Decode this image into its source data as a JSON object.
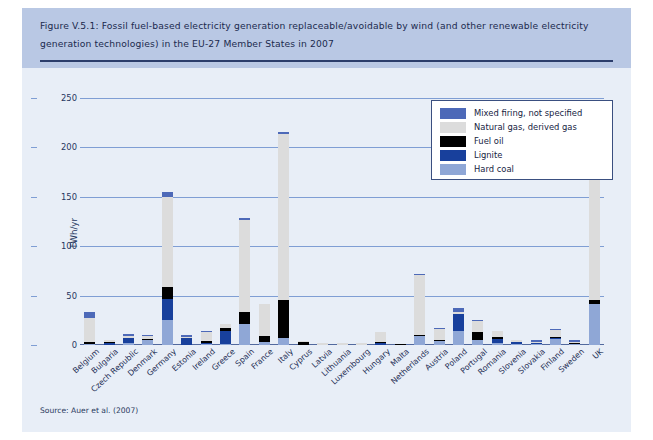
{
  "figure": {
    "title": "Figure V.5.1: Fossil fuel-based electricity generation replaceable/avoidable by wind (and other renewable electricity generation technologies) in the EU-27 Member States in 2007",
    "source": "Source: Auer et al. (2007)"
  },
  "colors": {
    "panel_background": "#e8eef7",
    "title_band": "#b9c8e4",
    "title_text": "#1b2a4e",
    "gridline": "#7f9ed4",
    "mixed_firing": "#4d69b8",
    "natural_gas": "#dcdcdc",
    "fuel_oil": "#000000",
    "lignite": "#18409c",
    "hard_coal": "#8fa7d6"
  },
  "chart_data": {
    "type": "bar",
    "stacked": true,
    "title": "Figure V.5.1: Fossil fuel-based electricity generation replaceable/avoidable by wind (and other renewable electricity generation technologies) in the EU-27 Member States in 2007",
    "xlabel": "",
    "ylabel": "TWh/yr",
    "ylim": [
      0,
      250
    ],
    "yticks": [
      0,
      50,
      100,
      150,
      200,
      250
    ],
    "grid": true,
    "legend_position": "upper-right",
    "categories": [
      "Belgium",
      "Bulgaria",
      "Czech Republic",
      "Denmark",
      "Germany",
      "Estonia",
      "Ireland",
      "Greece",
      "Spain",
      "France",
      "Italy",
      "Cyprus",
      "Latvia",
      "Lithuania",
      "Luxembourg",
      "Hungary",
      "Malta",
      "Netherlands",
      "Austria",
      "Poland",
      "Portugal",
      "Romania",
      "Slovenia",
      "Slovakia",
      "Finland",
      "Sweden",
      "UK"
    ],
    "series": [
      {
        "name": "Hard coal",
        "color": "#8fa7d6",
        "values": [
          1.0,
          0.5,
          2.0,
          5.0,
          25.0,
          0.0,
          1.0,
          1.0,
          21.0,
          3.0,
          7.0,
          0.0,
          0.0,
          0.0,
          0.0,
          0.5,
          0.0,
          9.0,
          4.0,
          14.0,
          5.0,
          2.0,
          1.0,
          1.0,
          6.0,
          1.0,
          42.0
        ]
      },
      {
        "name": "Lignite",
        "color": "#18409c",
        "values": [
          0.0,
          2.0,
          5.0,
          0.0,
          22.0,
          7.0,
          1.0,
          13.0,
          0.0,
          0.0,
          0.0,
          0.0,
          0.0,
          0.0,
          0.0,
          2.0,
          0.0,
          0.0,
          0.0,
          17.0,
          0.0,
          4.0,
          2.0,
          1.0,
          1.0,
          0.0,
          0.0
        ]
      },
      {
        "name": "Fuel oil",
        "color": "#000000",
        "values": [
          2.0,
          0.5,
          0.5,
          1.0,
          12.0,
          0.5,
          2.0,
          3.0,
          12.0,
          6.0,
          39.0,
          3.0,
          0.5,
          0.5,
          0.5,
          1.0,
          1.5,
          1.0,
          1.0,
          0.5,
          8.0,
          2.0,
          0.5,
          0.5,
          1.0,
          1.5,
          4.0
        ]
      },
      {
        "name": "Natural gas, derived gas",
        "color": "#dcdcdc",
        "values": [
          24.0,
          2.0,
          2.0,
          3.0,
          91.0,
          1.0,
          9.0,
          4.0,
          94.0,
          33.0,
          168.0,
          0.5,
          1.5,
          2.0,
          1.0,
          10.0,
          0.0,
          61.0,
          11.0,
          2.0,
          11.0,
          6.0,
          0.5,
          1.0,
          7.0,
          1.0,
          154.0
        ]
      },
      {
        "name": "Mixed firing, not specified",
        "color": "#4d69b8",
        "values": [
          6.0,
          0.0,
          1.0,
          1.0,
          5.0,
          1.0,
          1.0,
          0.0,
          2.0,
          0.0,
          1.0,
          0.0,
          0.0,
          0.0,
          0.0,
          0.0,
          0.0,
          1.0,
          1.0,
          4.0,
          1.0,
          0.0,
          0.0,
          0.5,
          0.5,
          0.5,
          0.0
        ]
      }
    ],
    "totals": [
      33,
      5,
      10.5,
      10,
      155,
      9.5,
      14,
      21,
      129,
      42,
      215,
      3.5,
      2,
      2.5,
      1.5,
      13.5,
      1.5,
      72,
      17,
      37.5,
      25,
      14,
      4,
      4,
      15.5,
      4,
      200
    ]
  },
  "legend": {
    "items": [
      {
        "label": "Mixed firing, not specified",
        "color": "#4d69b8"
      },
      {
        "label": "Natural gas, derived gas",
        "color": "#dcdcdc"
      },
      {
        "label": "Fuel oil",
        "color": "#000000"
      },
      {
        "label": "Lignite",
        "color": "#18409c"
      },
      {
        "label": "Hard coal",
        "color": "#8fa7d6"
      }
    ]
  }
}
